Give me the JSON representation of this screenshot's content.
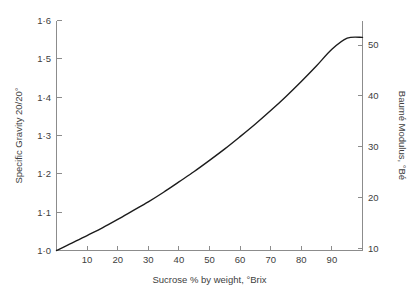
{
  "chart_data": {
    "type": "line",
    "title": "",
    "subtitle": "",
    "xlabel": "Sucrose % by weight, °Brix",
    "ylabel": "Specific Gravity 20/20°",
    "y2label": "Baumé Modulus, °Bé",
    "xlim": [
      0,
      100
    ],
    "ylim": [
      1.0,
      1.6
    ],
    "y2lim": [
      0,
      52.0
    ],
    "grid": false,
    "legend": null,
    "legend_position": "none",
    "xticks": [
      10,
      20,
      30,
      40,
      50,
      60,
      70,
      80,
      90
    ],
    "xtick_labels": [
      "10",
      "20",
      "30",
      "40",
      "50",
      "60",
      "70",
      "80",
      "90"
    ],
    "yticks": [
      1.0,
      1.1,
      1.2,
      1.3,
      1.4,
      1.5,
      1.6
    ],
    "ytick_labels": [
      "1·0",
      "1·1",
      "1·2",
      "1·3",
      "1·4",
      "1·5",
      "1·6"
    ],
    "y2ticks": [
      10,
      20,
      30,
      40,
      50
    ],
    "y2tick_labels": [
      "10",
      "20",
      "30",
      "40",
      "50"
    ],
    "series": [
      {
        "name": "Specific gravity vs Brix",
        "color": "#1c1c1c",
        "x": [
          0,
          5,
          10,
          15,
          20,
          25,
          30,
          35,
          40,
          45,
          50,
          55,
          60,
          65,
          70,
          75,
          80,
          85,
          90,
          95,
          100
        ],
        "y": [
          1.0,
          1.019,
          1.039,
          1.059,
          1.081,
          1.104,
          1.127,
          1.152,
          1.179,
          1.206,
          1.235,
          1.265,
          1.297,
          1.33,
          1.365,
          1.402,
          1.441,
          1.482,
          1.525,
          1.554,
          1.556
        ],
        "y2": [
          0.0,
          2.7,
          5.4,
          8.1,
          10.9,
          13.6,
          16.3,
          19.0,
          21.8,
          24.5,
          27.2,
          29.9,
          32.7,
          35.4,
          38.1,
          40.8,
          43.6,
          46.3,
          49.0,
          51.4,
          52.0
        ]
      }
    ]
  },
  "axes": {
    "left": {
      "label": "Specific Gravity 20/20°"
    },
    "right": {
      "label": "Baumé Modulus, °Bé"
    },
    "bottom": {
      "label": "Sucrose % by weight, °Brix"
    }
  },
  "colors": {
    "curve": "#1c1c1c",
    "axis": "#8c8c8c",
    "text": "#404040",
    "background": "#ffffff"
  }
}
